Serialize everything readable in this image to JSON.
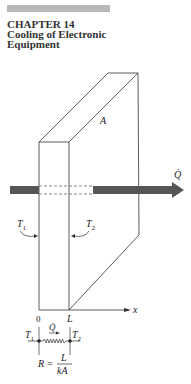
{
  "header": {
    "chapter_label": "CHAPTER 14",
    "title_line1": "Cooling of Electronic",
    "title_line2": "Equipment"
  },
  "figure": {
    "area_label": "A",
    "heat_rate_label": "Q̇",
    "left_temp_label": "T1",
    "right_temp_label": "T2",
    "axis_label": "x",
    "origin_label": "0",
    "thickness_label": "L",
    "circuit": {
      "heat_rate_label": "Q̇",
      "left_node_label": "T1",
      "right_node_label": "T2",
      "resistance_prefix": "R =",
      "numerator": "L",
      "denominator": "kA"
    },
    "colors": {
      "arrow": "#555555",
      "lines": "#333333",
      "header_bar": "#b8b8b8"
    }
  }
}
